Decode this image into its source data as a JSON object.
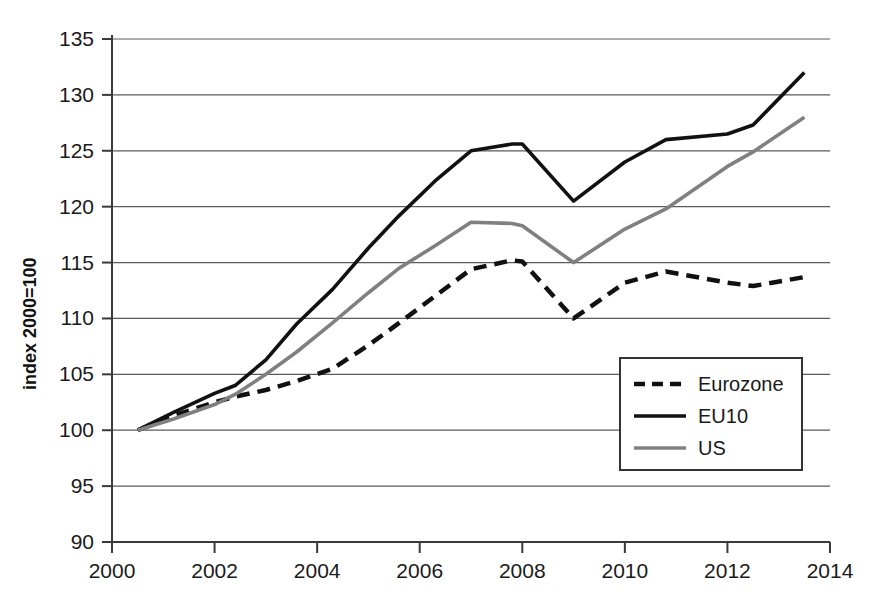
{
  "chart_data": {
    "type": "line",
    "title": "",
    "xlabel": "",
    "ylabel": "index 2000=100",
    "xlim": [
      2000,
      2014
    ],
    "ylim": [
      90,
      135
    ],
    "grid": true,
    "legend_position": "inside-lower-right",
    "x_ticks": [
      "2000",
      "2002",
      "2004",
      "2006",
      "2008",
      "2010",
      "2012",
      "2014"
    ],
    "y_ticks": [
      "90",
      "95",
      "100",
      "105",
      "110",
      "115",
      "120",
      "125",
      "130",
      "135"
    ],
    "x": [
      2000.5,
      2001.2,
      2002.0,
      2002.4,
      2003.0,
      2003.6,
      2004.3,
      2005.0,
      2005.6,
      2006.3,
      2007.0,
      2007.8,
      2008.0,
      2009.0,
      2010.0,
      2010.8,
      2012.0,
      2012.5,
      2013.5
    ],
    "series": [
      {
        "name": "Eurozone",
        "style": "dashed",
        "color": "#111111",
        "values": [
          100.0,
          101.3,
          102.5,
          103.0,
          103.6,
          104.4,
          105.5,
          107.6,
          109.6,
          112.0,
          114.4,
          115.2,
          115.1,
          110.0,
          113.2,
          114.2,
          113.2,
          112.9,
          113.7
        ]
      },
      {
        "name": "EU10",
        "style": "solid",
        "color": "#111111",
        "values": [
          100.0,
          101.6,
          103.3,
          104.0,
          106.3,
          109.5,
          112.6,
          116.3,
          119.2,
          122.3,
          125.0,
          125.6,
          125.6,
          120.5,
          124.0,
          126.0,
          126.5,
          127.3,
          132.0
        ]
      },
      {
        "name": "US",
        "style": "solid",
        "color": "#808080",
        "values": [
          100.0,
          101.0,
          102.3,
          103.2,
          105.0,
          107.0,
          109.6,
          112.3,
          114.5,
          116.5,
          118.6,
          118.5,
          118.3,
          115.0,
          118.0,
          119.8,
          123.6,
          124.9,
          128.0
        ]
      }
    ]
  },
  "legend": {
    "items": [
      {
        "label": "Eurozone"
      },
      {
        "label": "EU10"
      },
      {
        "label": "US"
      }
    ]
  }
}
